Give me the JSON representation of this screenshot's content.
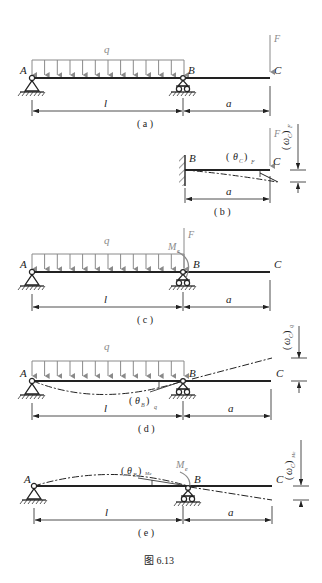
{
  "figure": {
    "caption": "图 6.13",
    "colors": {
      "line": "#222222",
      "load": "#8a8a8a",
      "background": "#ffffff"
    }
  },
  "labels": {
    "A": "A",
    "B": "B",
    "C": "C",
    "F": "F",
    "q": "q",
    "l": "l",
    "a": "a",
    "Me": "M",
    "Me_sub": "e",
    "theta": "θ",
    "omega": "ω"
  },
  "panels": [
    {
      "id": "a",
      "caption": "( a )",
      "description": "Overhanging beam with uniform load q on AB and point load F at C"
    },
    {
      "id": "b",
      "caption": "( b )",
      "description": "Cantilever BC fixed at B with load F; rotation (θ_C)_F and deflection (ω_C)_F",
      "theta_label": "(θ",
      "theta_sub": "C",
      "theta_tail": ")",
      "theta_subscript": "F",
      "omega_sub": "C",
      "omega_subscript": "F"
    },
    {
      "id": "c",
      "caption": "( c )",
      "description": "Equivalent system: q on AB, F and moment M_e at B"
    },
    {
      "id": "d",
      "caption": "( d )",
      "description": "Deflection due to q; rotation (θ_B)_q and deflection (ω_C)_q",
      "theta_sub": "B",
      "theta_subscript": "q",
      "omega_subscript": "q"
    },
    {
      "id": "e",
      "caption": "( e )",
      "description": "Deflection due to M_e; rotation (θ_B)_Me and deflection (ω_C)_Me",
      "theta_sub": "B",
      "theta_subscript": "Me",
      "omega_subscript": "Me"
    }
  ]
}
